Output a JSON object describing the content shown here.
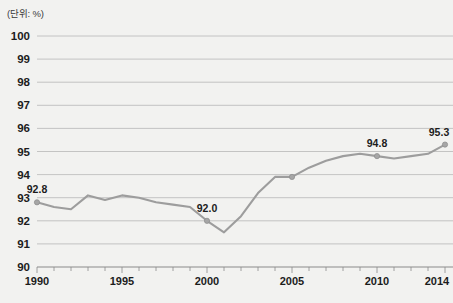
{
  "unit_note": "(단위: %)",
  "chart_data": {
    "type": "line",
    "title": "",
    "subtitle": "",
    "xlabel": "",
    "ylabel": "",
    "unit": "%",
    "unit_note": "(단위: %)",
    "grid": true,
    "legend": false,
    "legend_position": "none",
    "line_color": "#9d9d9d",
    "marker_color": "#a6a6a6",
    "background_color": "#f2f2f0",
    "gridline_color": "#b8b8b8",
    "xlim": [
      1990,
      2014
    ],
    "ylim": [
      90,
      100
    ],
    "ytick_step": 1,
    "yticks": [
      90,
      91,
      92,
      93,
      94,
      95,
      96,
      97,
      98,
      99,
      100
    ],
    "ytick_labels": [
      "90",
      "91",
      "92",
      "93",
      "94",
      "95",
      "96",
      "97",
      "98",
      "99",
      "100"
    ],
    "xticks_major": [
      1990,
      1995,
      2000,
      2005,
      2010,
      2014
    ],
    "xtick_labels": [
      "1990",
      "1995",
      "2000",
      "2005",
      "2010",
      "2014"
    ],
    "xticks_minor": [
      1991,
      1992,
      1993,
      1994,
      1996,
      1997,
      1998,
      1999,
      2001,
      2002,
      2003,
      2004,
      2006,
      2007,
      2008,
      2009,
      2011,
      2012,
      2013
    ],
    "x": [
      1990,
      1991,
      1992,
      1993,
      1994,
      1995,
      1996,
      1997,
      1998,
      1999,
      2000,
      2001,
      2002,
      2003,
      2004,
      2005,
      2006,
      2007,
      2008,
      2009,
      2010,
      2011,
      2012,
      2013,
      2014
    ],
    "values": [
      92.8,
      92.6,
      92.5,
      93.1,
      92.9,
      93.1,
      93.0,
      92.8,
      92.7,
      92.6,
      92.0,
      91.5,
      92.2,
      93.2,
      93.9,
      93.9,
      94.3,
      94.6,
      94.8,
      94.9,
      94.8,
      94.7,
      94.8,
      94.9,
      95.3
    ],
    "annotations": [
      {
        "x": 1990,
        "y": 92.8,
        "label": "92.8"
      },
      {
        "x": 2000,
        "y": 92.0,
        "label": "92.0"
      },
      {
        "x": 2010,
        "y": 94.8,
        "label": "94.8"
      },
      {
        "x": 2014,
        "y": 95.3,
        "label": "95.3"
      }
    ],
    "markers_at": [
      1990,
      2000,
      2005,
      2010,
      2014
    ]
  }
}
